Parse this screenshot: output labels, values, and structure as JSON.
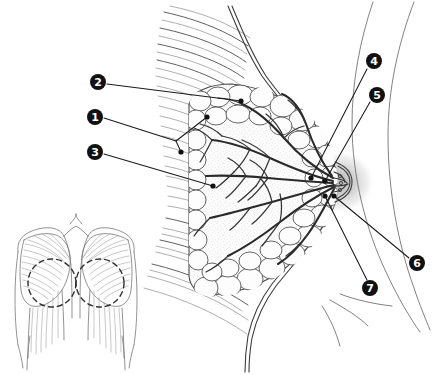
{
  "figure": {
    "background_color": "#ffffff",
    "width": 448,
    "height": 375,
    "line_color": "#3c3c3c",
    "marker_fill": "#111111",
    "marker_text_color": "#ffffff",
    "areola_halo_color": "#c9c9c9"
  },
  "callouts": [
    {
      "number": "1",
      "name": "callout-1",
      "marker_x": 95,
      "marker_y": 117,
      "leader_points": "104,118 176,141",
      "leader_points_2": "176,141 207,117",
      "dot_x": 207,
      "dot_y": 117,
      "dot2_x": 181,
      "dot2_y": 152
    },
    {
      "number": "2",
      "name": "callout-2",
      "marker_x": 98,
      "marker_y": 82,
      "leader_points": "107,84 241,101",
      "dot_x": 241,
      "dot_y": 101
    },
    {
      "number": "3",
      "name": "callout-3",
      "marker_x": 95,
      "marker_y": 152,
      "leader_points": "104,154 213,186",
      "dot_x": 213,
      "dot_y": 186
    },
    {
      "number": "4",
      "name": "callout-4",
      "marker_x": 374,
      "marker_y": 61,
      "leader_points": "367,69 311,178",
      "dot_x": 311,
      "dot_y": 178
    },
    {
      "number": "5",
      "name": "callout-5",
      "marker_x": 377,
      "marker_y": 95,
      "leader_points": "370,102 325,181",
      "dot_x": 325,
      "dot_y": 181
    },
    {
      "number": "6",
      "name": "callout-6",
      "marker_x": 417,
      "marker_y": 263,
      "leader_points": "409,258 334,196",
      "dot_x": 334,
      "dot_y": 196
    },
    {
      "number": "7",
      "name": "callout-7",
      "marker_x": 370,
      "marker_y": 288,
      "leader_points": "367,280 325,196",
      "dot_x": 325,
      "dot_y": 196
    }
  ],
  "inset": {
    "name": "torso-inset",
    "description": "Anterior torso showing pectoral muscles with dashed circles marking breast regions",
    "left_circle_x": 52,
    "left_circle_y": 283,
    "right_circle_x": 100,
    "right_circle_y": 283,
    "circle_r": 24
  }
}
